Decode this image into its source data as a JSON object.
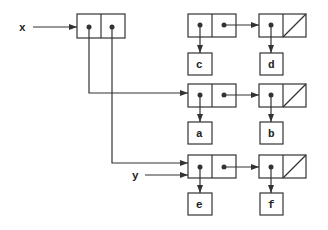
{
  "diagram": {
    "type": "box-and-pointer",
    "variables": [
      {
        "name": "x",
        "label": "x"
      },
      {
        "name": "y",
        "label": "y"
      }
    ],
    "atoms": [
      "c",
      "d",
      "a",
      "b",
      "e",
      "f"
    ],
    "rows": [
      {
        "cars": [
          "c",
          "d"
        ]
      },
      {
        "cars": [
          "a",
          "b"
        ]
      },
      {
        "cars": [
          "e",
          "f"
        ]
      }
    ],
    "colors": {
      "stroke": "#333333",
      "background": "#ffffff"
    }
  }
}
